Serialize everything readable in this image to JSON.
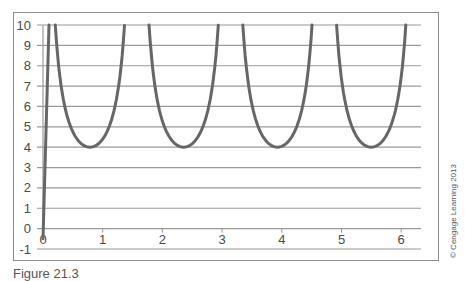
{
  "chart_data": {
    "type": "line",
    "title": "",
    "xlabel": "",
    "ylabel": "",
    "xlim": [
      0,
      6.2
    ],
    "ylim": [
      -1,
      10
    ],
    "x_ticks": [
      0,
      1,
      2,
      3,
      4,
      5,
      6
    ],
    "y_ticks": [
      -1,
      0,
      1,
      2,
      3,
      4,
      5,
      6,
      7,
      8,
      9,
      10
    ],
    "grid": {
      "horizontal": true,
      "vertical": false
    },
    "legend": null,
    "series": [
      {
        "name": "y = 4/|sin(2x)| (clipped at 10)",
        "color": "#666666",
        "points": [
          [
            0.0,
            -0.5
          ],
          [
            0.1,
            10
          ],
          [
            0.41,
            10
          ],
          [
            0.5,
            4.75
          ],
          [
            0.6,
            4.29
          ],
          [
            0.7,
            4.04
          ],
          [
            0.785,
            4.0
          ],
          [
            0.9,
            4.1
          ],
          [
            1.0,
            4.4
          ],
          [
            1.1,
            4.94
          ],
          [
            1.2,
            5.87
          ],
          [
            1.24,
            10
          ],
          [
            1.98,
            10
          ],
          [
            2.1,
            4.62
          ],
          [
            2.2,
            4.21
          ],
          [
            2.356,
            4.0
          ],
          [
            2.5,
            4.17
          ],
          [
            2.6,
            4.47
          ],
          [
            2.7,
            5.01
          ],
          [
            2.82,
            10
          ],
          [
            3.55,
            10
          ],
          [
            3.7,
            4.41
          ],
          [
            3.8,
            4.1
          ],
          [
            3.927,
            4.0
          ],
          [
            4.0,
            4.03
          ],
          [
            4.1,
            4.19
          ],
          [
            4.2,
            4.56
          ],
          [
            4.3,
            5.27
          ],
          [
            4.39,
            10
          ],
          [
            5.13,
            10
          ],
          [
            5.3,
            4.28
          ],
          [
            5.4,
            4.07
          ],
          [
            5.498,
            4.0
          ],
          [
            5.6,
            4.1
          ],
          [
            5.7,
            4.41
          ],
          [
            5.8,
            4.98
          ],
          [
            5.96,
            10
          ]
        ],
        "minima": [
          [
            0.785,
            4
          ],
          [
            2.356,
            4
          ],
          [
            3.927,
            4
          ],
          [
            5.498,
            4
          ]
        ]
      }
    ],
    "annotations": [
      "© Cengage Learning 2013"
    ]
  },
  "caption": "Figure 21.3",
  "copyright": "© Cengage Learning 2013"
}
